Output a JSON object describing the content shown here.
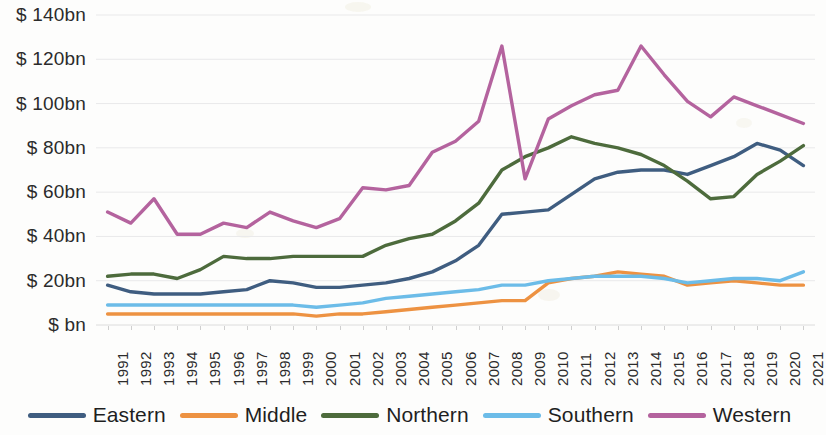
{
  "chart_data": {
    "type": "line",
    "title": "",
    "subtitle": "",
    "xlabel": "",
    "ylabel": "",
    "grid": true,
    "legend_position": "bottom",
    "ylim": [
      0,
      140
    ],
    "ytick_labels": [
      "$ 140bn",
      "$ 120bn",
      "$ 100bn",
      "$ 80bn",
      "$ 60bn",
      "$ 40bn",
      "$ 20bn",
      "$ bn"
    ],
    "ytick_values": [
      140,
      120,
      100,
      80,
      60,
      40,
      20,
      0
    ],
    "y_unit": "bn",
    "y_currency": "$",
    "categories": [
      "1991",
      "1992",
      "1993",
      "1994",
      "1995",
      "1996",
      "1997",
      "1998",
      "1999",
      "2000",
      "2001",
      "2002",
      "2003",
      "2004",
      "2005",
      "2006",
      "2007",
      "2008",
      "2009",
      "2010",
      "2011",
      "2012",
      "2013",
      "2014",
      "2015",
      "2016",
      "2017",
      "2018",
      "2019",
      "2020",
      "2021"
    ],
    "series": [
      {
        "name": "Eastern",
        "color": "#3f5d80",
        "values": [
          18,
          15,
          14,
          14,
          14,
          15,
          16,
          20,
          19,
          17,
          17,
          18,
          19,
          21,
          24,
          29,
          36,
          50,
          51,
          52,
          59,
          66,
          69,
          70,
          70,
          68,
          72,
          76,
          82,
          79,
          72
        ]
      },
      {
        "name": "Middle",
        "color": "#ed9242",
        "values": [
          5,
          5,
          5,
          5,
          5,
          5,
          5,
          5,
          5,
          4,
          5,
          5,
          6,
          7,
          8,
          9,
          10,
          11,
          11,
          19,
          21,
          22,
          24,
          23,
          22,
          18,
          19,
          20,
          19,
          18,
          18
        ]
      },
      {
        "name": "Northern",
        "color": "#4d6b3c",
        "values": [
          22,
          23,
          23,
          21,
          25,
          31,
          30,
          30,
          31,
          31,
          31,
          31,
          36,
          39,
          41,
          47,
          55,
          70,
          76,
          80,
          85,
          82,
          80,
          77,
          72,
          65,
          57,
          58,
          68,
          74,
          81
        ]
      },
      {
        "name": "Southern",
        "color": "#6cbce8",
        "values": [
          9,
          9,
          9,
          9,
          9,
          9,
          9,
          9,
          9,
          8,
          9,
          10,
          12,
          13,
          14,
          15,
          16,
          18,
          18,
          20,
          21,
          22,
          22,
          22,
          21,
          19,
          20,
          21,
          21,
          20,
          24
        ]
      },
      {
        "name": "Western",
        "color": "#b4639e",
        "values": [
          51,
          46,
          57,
          41,
          41,
          46,
          44,
          51,
          47,
          44,
          48,
          62,
          61,
          63,
          78,
          83,
          92,
          126,
          66,
          93,
          99,
          104,
          106,
          126,
          113,
          101,
          94,
          103,
          99,
          95,
          91
        ]
      }
    ]
  },
  "legend": {
    "items": [
      {
        "label": "Eastern",
        "color": "#3f5d80"
      },
      {
        "label": "Middle",
        "color": "#ed9242"
      },
      {
        "label": "Northern",
        "color": "#4d6b3c"
      },
      {
        "label": "Southern",
        "color": "#6cbce8"
      },
      {
        "label": "Western",
        "color": "#b4639e"
      }
    ]
  }
}
